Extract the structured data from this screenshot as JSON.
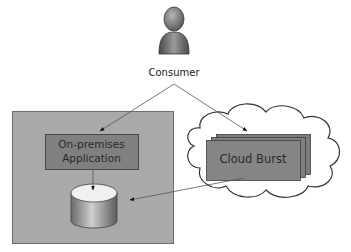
{
  "diagram": {
    "nodes": {
      "consumer": {
        "label": "Consumer",
        "icon": "user-icon"
      },
      "on_premises": {
        "label_line1": "On-premises",
        "label_line2": "Application"
      },
      "cloud_burst": {
        "label": "Cloud Burst"
      },
      "database": {
        "icon": "database-icon"
      },
      "datacenter": {
        "label": ""
      },
      "cloud": {
        "label": ""
      }
    },
    "edges": [
      {
        "from": "consumer",
        "to": "on_premises"
      },
      {
        "from": "consumer",
        "to": "cloud_burst"
      },
      {
        "from": "on_premises",
        "to": "database"
      },
      {
        "from": "cloud_burst",
        "to": "datacenter"
      }
    ],
    "colors": {
      "datacenter_fill": "#a9a9a9",
      "app_fill": "#808080",
      "cloud_burst_fill": "#858585",
      "cloud_stroke": "#333333",
      "line": "#555555"
    }
  }
}
